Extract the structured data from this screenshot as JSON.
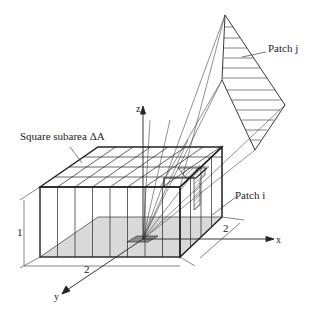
{
  "labels": {
    "subarea": "Square subarea ΔA",
    "patch_j": "Patch j",
    "patch_i": "Patch i",
    "axis_z": "z",
    "axis_x": "x",
    "axis_y": "y",
    "dim_height": "1",
    "dim_width": "2",
    "dim_depth": "2"
  },
  "colors": {
    "line": "#1a1a1a",
    "floor_shade": "#d9d9d9",
    "patch_shade": "#c8c8c8",
    "background": "#ffffff"
  }
}
